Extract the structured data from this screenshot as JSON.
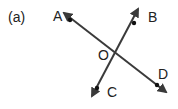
{
  "figure": {
    "part_label": "(a)",
    "points": {
      "A": "A",
      "B": "B",
      "C": "C",
      "D": "D",
      "O": "O"
    },
    "lines": [
      {
        "name": "AD",
        "from": "A",
        "to": "D",
        "through": "O"
      },
      {
        "name": "BC",
        "from": "B",
        "to": "C",
        "through": "O"
      }
    ],
    "colors": {
      "line": "#3a3a3a",
      "text": "#222222",
      "background": "#ffffff"
    }
  }
}
